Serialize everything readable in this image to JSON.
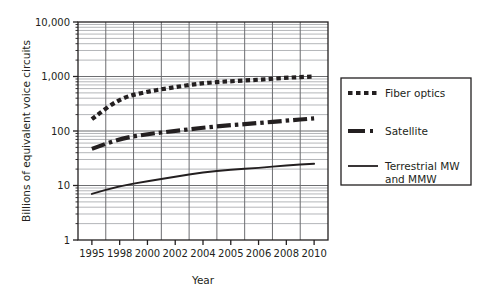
{
  "chart_data": {
    "type": "line",
    "title": "",
    "xlabel": "Year",
    "ylabel": "Billions of equivalent voice circuits",
    "x_scale": "ordinal",
    "y_scale": "log",
    "ylim": [
      1,
      10000
    ],
    "grid": true,
    "grid_minor": true,
    "legend_position": "right",
    "categories": [
      "1995",
      "1998",
      "2000",
      "2002",
      "2004",
      "2005",
      "2006",
      "2008",
      "2010"
    ],
    "y_tick_labels": [
      "1",
      "10",
      "100",
      "1,000",
      "10,000"
    ],
    "y_tick_values": [
      1,
      10,
      100,
      1000,
      10000
    ],
    "series": [
      {
        "name": "Fiber optics",
        "style": "dotted-thick",
        "values": [
          165,
          400,
          530,
          640,
          760,
          820,
          870,
          950,
          1000
        ]
      },
      {
        "name": "Satellite",
        "style": "dash-dot-thick",
        "values": [
          47,
          72,
          88,
          100,
          115,
          128,
          140,
          155,
          170
        ]
      },
      {
        "name": "Terrestrial MW and MMW",
        "style": "solid",
        "values": [
          7.0,
          9.8,
          12.0,
          14.5,
          17.5,
          19.5,
          21.0,
          23.5,
          25.0
        ]
      }
    ]
  },
  "legend": {
    "entries": [
      {
        "label": "Fiber optics",
        "style": "dotted-thick"
      },
      {
        "label": "Satellite",
        "style": "dash-dot-thick"
      },
      {
        "label_line1": "Terrestrial MW",
        "label_line2": "and MMW",
        "style": "solid"
      }
    ]
  },
  "colors": {
    "ink": "#231f20",
    "grid_major": "#6d6e71",
    "grid_minor": "#a7a9ac",
    "background": "#ffffff"
  }
}
